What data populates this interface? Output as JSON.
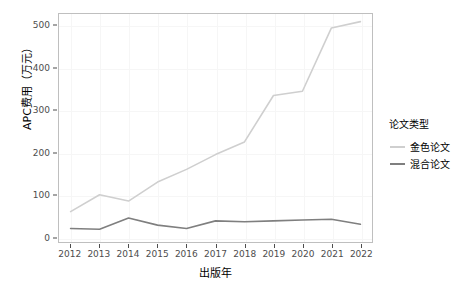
{
  "chart_data": {
    "type": "line",
    "title": "",
    "xlabel": "出版年",
    "ylabel": "APC费用（万元）",
    "x": [
      2012,
      2013,
      2014,
      2015,
      2016,
      2017,
      2018,
      2019,
      2020,
      2021,
      2022
    ],
    "xtick_labels": [
      "2012",
      "2013",
      "2014",
      "2015",
      "2016",
      "2017",
      "2018",
      "2019",
      "2020",
      "2021",
      "2022"
    ],
    "ytick_labels": [
      "0",
      "100",
      "200",
      "300",
      "400",
      "500"
    ],
    "yticks": [
      0,
      100,
      200,
      300,
      400,
      500
    ],
    "ylim": [
      -12,
      528
    ],
    "xlim": [
      2011.6,
      2022.4
    ],
    "grid": true,
    "legend": {
      "title": "论文类型",
      "position": "right",
      "entries": [
        "金色论文",
        "混合论文"
      ]
    },
    "series": [
      {
        "name": "金色论文",
        "color": "#cfcfcf",
        "values": [
          60,
          100,
          85,
          130,
          160,
          195,
          225,
          335,
          345,
          495,
          510
        ]
      },
      {
        "name": "混合论文",
        "color": "#7f7f7f",
        "values": [
          20,
          18,
          45,
          28,
          20,
          38,
          36,
          38,
          40,
          42,
          30
        ]
      }
    ]
  },
  "colors": {
    "panel_border": "#bfbfbf",
    "grid": "#f6f6f6",
    "axis_text": "#4d4d4d",
    "label_text": "#000000",
    "background": "#ffffff"
  }
}
